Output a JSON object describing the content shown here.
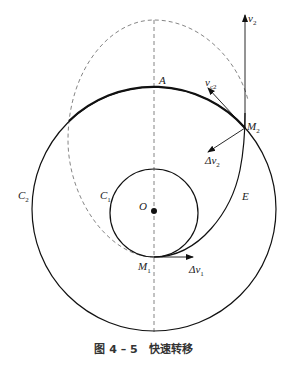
{
  "figure": {
    "caption": "图 4 – 5　快速转移"
  },
  "labels": {
    "A": "A",
    "O": "O",
    "C1": "C",
    "C1_sub": "1",
    "C2": "C",
    "C2_sub": "2",
    "E": "E",
    "M1": "M",
    "M1_sub": "1",
    "M2": "M",
    "M2_sub": "2",
    "v2": "v",
    "v2_sub": "2",
    "vc2": "v",
    "vc2_sub": "c2",
    "dv1": "Δv",
    "dv1_sub": "1",
    "dv2": "Δv",
    "dv2_sub": "2"
  },
  "colors": {
    "solid": "#111111",
    "dashed": "#777777"
  }
}
